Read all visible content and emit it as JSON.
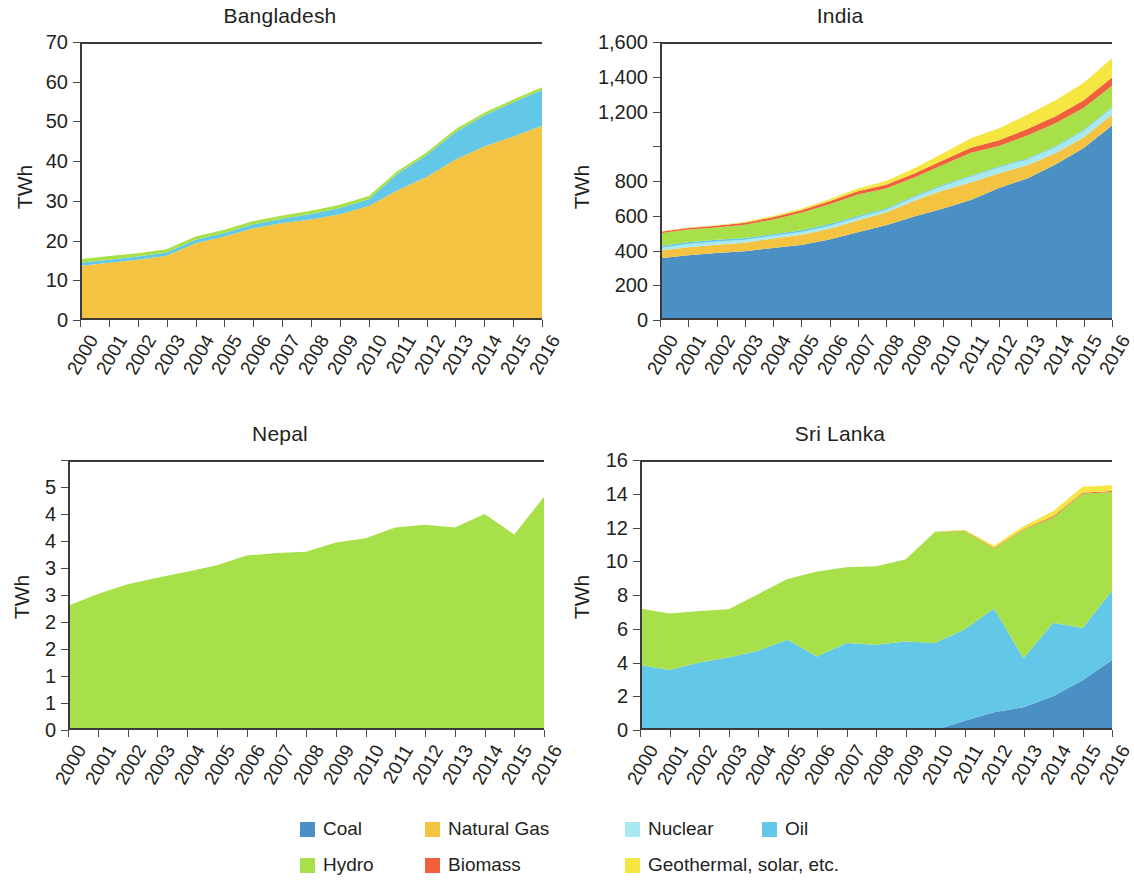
{
  "chart_data": [
    {
      "type": "area",
      "title": "Bangladesh",
      "xlabel": "",
      "ylabel": "TWh",
      "ylim": [
        0,
        70
      ],
      "yticks": [
        0,
        10,
        20,
        30,
        40,
        50,
        60,
        70
      ],
      "ytick_labels": [
        "0",
        "10",
        "20",
        "30",
        "40",
        "50",
        "60",
        "70"
      ],
      "grid": false,
      "legend_position": "bottom",
      "x": [
        2000,
        2001,
        2002,
        2003,
        2004,
        2005,
        2006,
        2007,
        2008,
        2009,
        2010,
        2011,
        2012,
        2013,
        2014,
        2015,
        2016
      ],
      "series": [
        {
          "name": "Coal",
          "values": [
            0.0,
            0.0,
            0.0,
            0.0,
            0.3,
            0.4,
            0.4,
            0.4,
            0.4,
            0.4,
            0.4,
            0.4,
            0.4,
            0.4,
            0.4,
            0.4,
            0.4
          ]
        },
        {
          "name": "Natural Gas",
          "values": [
            13.6,
            14.4,
            15.2,
            16.2,
            19.0,
            20.6,
            22.7,
            24.0,
            24.9,
            26.2,
            28.3,
            32.3,
            35.6,
            40.0,
            43.3,
            45.8,
            48.5
          ]
        },
        {
          "name": "Nuclear",
          "values": [
            0,
            0,
            0,
            0,
            0,
            0,
            0,
            0,
            0,
            0,
            0,
            0,
            0,
            0,
            0,
            0,
            0
          ]
        },
        {
          "name": "Oil",
          "values": [
            0.8,
            0.8,
            0.8,
            0.8,
            0.9,
            0.9,
            1.0,
            1.1,
            1.4,
            1.6,
            1.7,
            4.1,
            5.5,
            6.9,
            7.8,
            8.6,
            9.0
          ]
        },
        {
          "name": "Hydro",
          "values": [
            0.9,
            0.9,
            0.8,
            0.8,
            0.8,
            0.8,
            0.8,
            0.8,
            0.8,
            0.8,
            0.8,
            0.7,
            0.7,
            0.7,
            0.7,
            0.7,
            0.7
          ]
        },
        {
          "name": "Biomass",
          "values": [
            0,
            0,
            0,
            0,
            0,
            0,
            0,
            0,
            0,
            0,
            0,
            0,
            0,
            0,
            0,
            0,
            0
          ]
        },
        {
          "name": "Geothermal, solar, etc.",
          "values": [
            0,
            0,
            0,
            0,
            0,
            0,
            0,
            0,
            0,
            0,
            0,
            0,
            0,
            0,
            0,
            0,
            0
          ]
        }
      ]
    },
    {
      "type": "area",
      "title": "India",
      "xlabel": "",
      "ylabel": "TWh",
      "ylim": [
        0,
        1600
      ],
      "yticks": [
        0,
        200,
        400,
        600,
        800,
        1000,
        1200,
        1400,
        1600
      ],
      "ytick_labels": [
        "0",
        "200",
        "400",
        "600",
        "800",
        "",
        "1,200",
        "1,400",
        "1,600"
      ],
      "grid": false,
      "legend_position": "bottom",
      "x": [
        2000,
        2001,
        2002,
        2003,
        2004,
        2005,
        2006,
        2007,
        2008,
        2009,
        2010,
        2011,
        2012,
        2013,
        2014,
        2015,
        2016
      ],
      "series": [
        {
          "name": "Coal",
          "values": [
            355,
            372,
            385,
            395,
            415,
            432,
            463,
            505,
            545,
            595,
            640,
            690,
            760,
            815,
            895,
            990,
            1120
          ]
        },
        {
          "name": "Natural Gas",
          "values": [
            45,
            47,
            48,
            50,
            54,
            58,
            62,
            68,
            74,
            92,
            105,
            102,
            85,
            75,
            65,
            62,
            62
          ]
        },
        {
          "name": "Nuclear",
          "values": [
            16,
            18,
            19,
            17,
            16,
            17,
            18,
            17,
            15,
            19,
            26,
            32,
            33,
            34,
            35,
            37,
            38
          ]
        },
        {
          "name": "Oil",
          "values": [
            10,
            10,
            10,
            10,
            9,
            9,
            9,
            9,
            8,
            7,
            7,
            6,
            6,
            6,
            6,
            6,
            6
          ]
        },
        {
          "name": "Hydro",
          "values": [
            74,
            74,
            70,
            76,
            85,
            101,
            114,
            123,
            115,
            107,
            114,
            132,
            117,
            132,
            131,
            126,
            122
          ]
        },
        {
          "name": "Biomass",
          "values": [
            8,
            9,
            10,
            11,
            13,
            15,
            17,
            19,
            21,
            23,
            26,
            29,
            33,
            37,
            41,
            44,
            47
          ]
        },
        {
          "name": "Geothermal, solar, etc.",
          "values": [
            2,
            3,
            4,
            5,
            7,
            9,
            12,
            16,
            22,
            30,
            40,
            55,
            70,
            82,
            92,
            100,
            112
          ]
        }
      ]
    },
    {
      "type": "area",
      "title": "Nepal",
      "xlabel": "",
      "ylabel": "TWh",
      "ylim": [
        0,
        5
      ],
      "yticks": [
        0,
        0.5,
        1,
        1.5,
        2,
        2.5,
        3,
        3.5,
        4,
        4.5,
        5
      ],
      "ytick_labels": [
        "0",
        "1",
        "1",
        "2",
        "2",
        "3",
        "3",
        "4",
        "4",
        "5"
      ],
      "grid": false,
      "legend_position": "bottom",
      "x": [
        2000,
        2001,
        2002,
        2003,
        2004,
        2005,
        2006,
        2007,
        2008,
        2009,
        2010,
        2011,
        2012,
        2013,
        2014,
        2015,
        2016
      ],
      "series": [
        {
          "name": "Coal",
          "values": [
            0,
            0,
            0,
            0,
            0,
            0,
            0,
            0,
            0,
            0,
            0,
            0,
            0,
            0,
            0,
            0,
            0
          ]
        },
        {
          "name": "Natural Gas",
          "values": [
            0,
            0,
            0,
            0,
            0,
            0,
            0,
            0,
            0,
            0,
            0,
            0,
            0,
            0,
            0,
            0,
            0
          ]
        },
        {
          "name": "Nuclear",
          "values": [
            0,
            0,
            0,
            0,
            0,
            0,
            0,
            0,
            0,
            0,
            0,
            0,
            0,
            0,
            0,
            0,
            0
          ]
        },
        {
          "name": "Oil",
          "values": [
            0,
            0,
            0,
            0,
            0,
            0,
            0,
            0,
            0,
            0,
            0,
            0,
            0,
            0,
            0,
            0,
            0
          ]
        },
        {
          "name": "Hydro",
          "values": [
            2.3,
            2.52,
            2.7,
            2.82,
            2.93,
            3.05,
            3.23,
            3.28,
            3.3,
            3.47,
            3.55,
            3.75,
            3.8,
            3.75,
            4.0,
            3.62,
            4.32
          ]
        },
        {
          "name": "Biomass",
          "values": [
            0,
            0,
            0,
            0,
            0,
            0,
            0,
            0,
            0,
            0,
            0,
            0,
            0,
            0,
            0,
            0,
            0
          ]
        },
        {
          "name": "Geothermal, solar, etc.",
          "values": [
            0,
            0,
            0,
            0,
            0,
            0,
            0,
            0,
            0,
            0,
            0,
            0,
            0,
            0,
            0,
            0,
            0
          ]
        }
      ]
    },
    {
      "type": "area",
      "title": "Sri Lanka",
      "xlabel": "",
      "ylabel": "TWh",
      "ylim": [
        0,
        16
      ],
      "yticks": [
        0,
        2,
        4,
        6,
        8,
        10,
        12,
        14,
        16
      ],
      "ytick_labels": [
        "0",
        "2",
        "4",
        "6",
        "8",
        "10",
        "12",
        "14",
        "16"
      ],
      "grid": false,
      "legend_position": "bottom",
      "x": [
        2000,
        2001,
        2002,
        2003,
        2004,
        2005,
        2006,
        2007,
        2008,
        2009,
        2010,
        2011,
        2012,
        2013,
        2014,
        2015,
        2016
      ],
      "series": [
        {
          "name": "Coal",
          "values": [
            0,
            0,
            0,
            0,
            0,
            0,
            0,
            0,
            0,
            0,
            0,
            0.55,
            1.05,
            1.35,
            2.0,
            2.95,
            4.15
          ]
        },
        {
          "name": "Natural Gas",
          "values": [
            0,
            0,
            0,
            0,
            0,
            0,
            0,
            0,
            0,
            0,
            0,
            0,
            0,
            0,
            0,
            0,
            0
          ]
        },
        {
          "name": "Nuclear",
          "values": [
            0,
            0,
            0,
            0,
            0,
            0,
            0,
            0,
            0,
            0,
            0,
            0,
            0,
            0,
            0,
            0,
            0
          ]
        },
        {
          "name": "Oil",
          "values": [
            3.85,
            3.55,
            4.0,
            4.3,
            4.7,
            5.35,
            4.35,
            5.15,
            5.05,
            5.25,
            5.15,
            5.4,
            6.15,
            2.9,
            4.35,
            3.1,
            4.1
          ]
        },
        {
          "name": "Hydro",
          "values": [
            3.35,
            3.35,
            3.05,
            2.85,
            3.35,
            3.6,
            5.05,
            4.5,
            4.65,
            4.85,
            6.6,
            5.85,
            3.55,
            7.6,
            6.25,
            7.95,
            5.85
          ]
        },
        {
          "name": "Biomass",
          "values": [
            0,
            0,
            0,
            0,
            0,
            0,
            0,
            0,
            0,
            0,
            0,
            0.02,
            0.05,
            0.05,
            0.06,
            0.06,
            0.06
          ]
        },
        {
          "name": "Geothermal, solar, etc.",
          "values": [
            0,
            0,
            0,
            0,
            0,
            0,
            0,
            0,
            0,
            0,
            0,
            0.05,
            0.12,
            0.18,
            0.3,
            0.35,
            0.35
          ]
        }
      ]
    }
  ],
  "panels": {
    "bangladesh": {
      "title": "Bangladesh",
      "ylabel": "TWh"
    },
    "india": {
      "title": "India",
      "ylabel": "TWh"
    },
    "nepal": {
      "title": "Nepal",
      "ylabel": "TWh"
    },
    "srilanka": {
      "title": "Sri Lanka",
      "ylabel": "TWh"
    }
  },
  "legend": {
    "row1": [
      {
        "label": "Coal",
        "color": "#4a90c4"
      },
      {
        "label": "Natural Gas",
        "color": "#f5c342"
      },
      {
        "label": "Nuclear",
        "color": "#a8e8f0"
      },
      {
        "label": "Oil",
        "color": "#63c7e8"
      }
    ],
    "row2": [
      {
        "label": "Hydro",
        "color": "#a8e04a"
      },
      {
        "label": "Biomass",
        "color": "#f0603c"
      },
      {
        "label": "Geothermal, solar, etc.",
        "color": "#f5e642"
      }
    ]
  },
  "colors": {
    "coal": "#4a90c4",
    "natural_gas": "#f5c342",
    "nuclear": "#a8e8f0",
    "oil": "#63c7e8",
    "hydro": "#a8e04a",
    "biomass": "#f0603c",
    "geothermal_solar": "#f5e642",
    "axis": "#3a3a3a",
    "text": "#231f20"
  }
}
